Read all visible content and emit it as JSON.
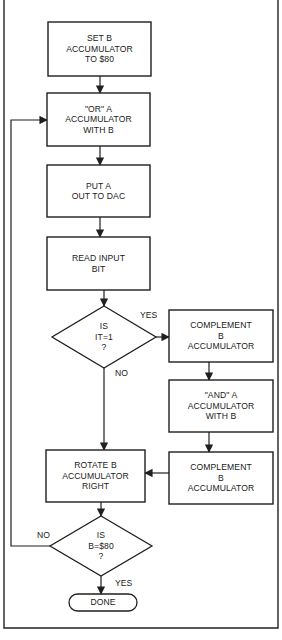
{
  "diagram": {
    "type": "flowchart",
    "frame": {
      "left": 4,
      "right": 278,
      "top": 0,
      "bottom": 628,
      "stroke": "#222222"
    },
    "nodes": [
      {
        "id": "set_b",
        "shape": "rect",
        "x": 48,
        "y": 22,
        "w": 103,
        "h": 54,
        "text": "SET B\nACCUMULATOR\nTO $80"
      },
      {
        "id": "or_a",
        "shape": "rect",
        "x": 47,
        "y": 93,
        "w": 103,
        "h": 53,
        "text": "\"OR\" A\nACCUMULATOR\nWITH B"
      },
      {
        "id": "put_a",
        "shape": "rect",
        "x": 47,
        "y": 165,
        "w": 103,
        "h": 52,
        "text": "PUT A\nOUT TO DAC"
      },
      {
        "id": "read_bit",
        "shape": "rect",
        "x": 47,
        "y": 237,
        "w": 103,
        "h": 53,
        "text": "READ INPUT\nBIT"
      },
      {
        "id": "is_it_1",
        "shape": "diamond",
        "cx": 104,
        "cy": 337,
        "hw": 52,
        "hh": 31,
        "text": "IS\nIT=1\n?"
      },
      {
        "id": "comp_b_1",
        "shape": "rect",
        "x": 169,
        "y": 310,
        "w": 104,
        "h": 52,
        "text": "COMPLEMENT\nB\nACCUMULATOR"
      },
      {
        "id": "and_a",
        "shape": "rect",
        "x": 169,
        "y": 380,
        "w": 104,
        "h": 52,
        "text": "\"AND\" A\nACCUMULATOR\nWITH B"
      },
      {
        "id": "comp_b_2",
        "shape": "rect",
        "x": 169,
        "y": 452,
        "w": 104,
        "h": 52,
        "text": "COMPLEMENT\nB\nACCUMULATOR"
      },
      {
        "id": "rotate_b",
        "shape": "rect",
        "x": 46,
        "y": 450,
        "w": 99,
        "h": 52,
        "text": "ROTATE B\nACCUMULATOR\nRIGHT"
      },
      {
        "id": "is_b_80",
        "shape": "diamond",
        "cx": 101,
        "cy": 546,
        "hw": 51,
        "hh": 30,
        "text": "IS\nB=$80\n?"
      },
      {
        "id": "done",
        "shape": "terminal",
        "x": 69,
        "y": 594,
        "w": 68,
        "h": 17,
        "text": "DONE"
      }
    ],
    "edges": [
      {
        "from": "set_b",
        "to": "or_a",
        "points": [
          [
            100,
            76
          ],
          [
            100,
            93
          ]
        ]
      },
      {
        "from": "or_a",
        "to": "put_a",
        "points": [
          [
            100,
            146
          ],
          [
            100,
            165
          ]
        ]
      },
      {
        "from": "put_a",
        "to": "read_bit",
        "points": [
          [
            100,
            217
          ],
          [
            100,
            237
          ]
        ]
      },
      {
        "from": "read_bit",
        "to": "is_it_1",
        "points": [
          [
            104,
            290
          ],
          [
            104,
            306
          ]
        ]
      },
      {
        "from": "is_it_1",
        "to": "comp_b_1",
        "label": "YES",
        "points": [
          [
            156,
            337
          ],
          [
            169,
            337
          ]
        ]
      },
      {
        "from": "is_it_1",
        "to": "rotate_b",
        "label": "NO",
        "points": [
          [
            104,
            368
          ],
          [
            104,
            450
          ]
        ]
      },
      {
        "from": "comp_b_1",
        "to": "and_a",
        "points": [
          [
            209,
            362
          ],
          [
            209,
            380
          ]
        ]
      },
      {
        "from": "and_a",
        "to": "comp_b_2",
        "points": [
          [
            209,
            432
          ],
          [
            209,
            452
          ]
        ]
      },
      {
        "from": "comp_b_2",
        "to": "rotate_b",
        "points": [
          [
            169,
            473
          ],
          [
            145,
            473
          ]
        ]
      },
      {
        "from": "rotate_b",
        "to": "is_b_80",
        "points": [
          [
            101,
            502
          ],
          [
            101,
            516
          ]
        ]
      },
      {
        "from": "is_b_80",
        "to": "or_a",
        "label": "NO",
        "points": [
          [
            50,
            546
          ],
          [
            11,
            546
          ],
          [
            11,
            120
          ],
          [
            47,
            120
          ]
        ]
      },
      {
        "from": "is_b_80",
        "to": "done",
        "label": "YES",
        "points": [
          [
            101,
            576
          ],
          [
            101,
            594
          ]
        ]
      }
    ],
    "edge_labels": [
      {
        "text": "YES",
        "x": 140,
        "y": 310
      },
      {
        "text": "NO",
        "x": 115,
        "y": 368
      },
      {
        "text": "NO",
        "x": 37,
        "y": 530
      },
      {
        "text": "YES",
        "x": 115,
        "y": 578
      }
    ],
    "colors": {
      "line": "#1f1f1f",
      "text": "#1a1a1a",
      "background": "#ffffff"
    }
  }
}
